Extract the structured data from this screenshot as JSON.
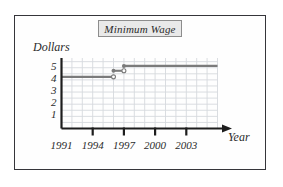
{
  "figure": {
    "title": "Minimum Wage",
    "title_boxed": true
  },
  "axes": {
    "ylabel": "Dollars",
    "xlabel": "Year",
    "yticks": [
      "5",
      "4",
      "3",
      "2",
      "1"
    ],
    "xticks": [
      "1991",
      "1994",
      "1997",
      "2000",
      "2003"
    ]
  },
  "colors": {
    "frame_border": "#35353a",
    "axis": "#1d1d1d",
    "grid": "#d6d9de",
    "series": "#7b7b7b",
    "title_fill": "#e9e9e9",
    "title_border": "#8d8d8d",
    "background": "#fefefe"
  },
  "chart_data": {
    "type": "line",
    "subtype": "step",
    "title": "Minimum Wage",
    "xlabel": "Year",
    "ylabel": "Dollars",
    "xlim": [
      1991,
      2006
    ],
    "ylim": [
      0,
      5.8
    ],
    "grid": true,
    "legend": false,
    "xtick_values": [
      1991,
      1994,
      1997,
      2000,
      2003
    ],
    "ytick_values": [
      1,
      2,
      3,
      4,
      5
    ],
    "steps": [
      {
        "x_start": 1991,
        "x_end": 1996,
        "y": 4.25,
        "start_point": "none",
        "end_point": "open"
      },
      {
        "x_start": 1996,
        "x_end": 1997,
        "y": 4.75,
        "start_point": "closed",
        "end_point": "open"
      },
      {
        "x_start": 1997,
        "x_end": 2006,
        "y": 5.15,
        "start_point": "closed",
        "end_point": "none"
      }
    ],
    "series": [
      {
        "name": "Minimum wage",
        "x": [
          1991,
          1996,
          1996,
          1997,
          1997,
          2006
        ],
        "values": [
          4.25,
          4.25,
          4.75,
          4.75,
          5.15,
          5.15
        ]
      }
    ]
  }
}
